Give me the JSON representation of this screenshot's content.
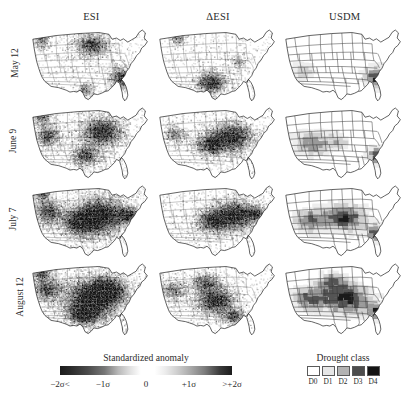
{
  "figure": {
    "columns": [
      {
        "id": "esi",
        "label": "ESI"
      },
      {
        "id": "desi",
        "label": "ΔESI"
      },
      {
        "id": "usdm",
        "label": "USDM"
      }
    ],
    "rows": [
      {
        "id": "may12",
        "label": "May 12"
      },
      {
        "id": "june9",
        "label": "June 9"
      },
      {
        "id": "july7",
        "label": "July 7"
      },
      {
        "id": "august12",
        "label": "August 12"
      }
    ]
  },
  "legend_anomaly": {
    "title": "Standardized anomaly",
    "ticks": [
      {
        "label": "−2σ<",
        "pos": 0
      },
      {
        "label": "−1σ",
        "pos": 25
      },
      {
        "label": "0",
        "pos": 50
      },
      {
        "label": "+1σ",
        "pos": 75
      },
      {
        "label": ">+2σ",
        "pos": 100
      }
    ]
  },
  "legend_drought": {
    "title": "Drought class",
    "classes": [
      {
        "label": "D0",
        "color": "#ffffff"
      },
      {
        "label": "D1",
        "color": "#e6e6e6"
      },
      {
        "label": "D2",
        "color": "#b3b3b3"
      },
      {
        "label": "D3",
        "color": "#4d4d4d"
      },
      {
        "label": "D4",
        "color": "#141414"
      }
    ]
  },
  "chart_data": {
    "type": "heatmap",
    "title": "Standardized anomaly",
    "xlabel": "",
    "ylabel": "",
    "grid": false,
    "legend_position": "bottom",
    "categories": [
      "ESI",
      "ΔESI",
      "USDM"
    ],
    "rows": [
      "May 12",
      "June 9",
      "July 7",
      "August 12"
    ],
    "colormap": "grayscale-diverging",
    "value_range": [
      -2,
      2
    ],
    "units": "standardized anomaly (sigma)",
    "panels": [
      {
        "row": "May 12",
        "column": "ESI",
        "metric": "standardized anomaly",
        "drought_extent_fraction": 0.18,
        "peak_intensity": -2.0,
        "centers": [
          {
            "name": "Upper Midwest",
            "x": 0.5,
            "y": 0.24,
            "rx": 0.13,
            "ry": 0.14,
            "intensity": -1.7
          },
          {
            "name": "Southeast / Georgia",
            "x": 0.74,
            "y": 0.66,
            "rx": 0.09,
            "ry": 0.13,
            "intensity": -2.0
          },
          {
            "name": "Northwest",
            "x": 0.1,
            "y": 0.17,
            "rx": 0.07,
            "ry": 0.1,
            "intensity": -1.4
          },
          {
            "name": "Texas coast",
            "x": 0.45,
            "y": 0.82,
            "rx": 0.07,
            "ry": 0.08,
            "intensity": -1.2
          }
        ],
        "texture": "fine-speckle",
        "speckle_density": 0.55
      },
      {
        "row": "May 12",
        "column": "ΔESI",
        "metric": "change in standardized anomaly",
        "drought_extent_fraction": 0.12,
        "peak_intensity": -2.0,
        "centers": [
          {
            "name": "Southern Plains / Texas",
            "x": 0.44,
            "y": 0.72,
            "rx": 0.11,
            "ry": 0.14,
            "intensity": -2.0
          },
          {
            "name": "Northern Rockies",
            "x": 0.17,
            "y": 0.16,
            "rx": 0.06,
            "ry": 0.08,
            "intensity": -1.2
          },
          {
            "name": "Ohio Valley",
            "x": 0.66,
            "y": 0.45,
            "rx": 0.06,
            "ry": 0.07,
            "intensity": -1.1
          }
        ],
        "texture": "fine-speckle",
        "speckle_density": 0.42
      },
      {
        "row": "May 12",
        "column": "USDM",
        "metric": "drought class",
        "drought_extent_fraction": 0.1,
        "peak_intensity": -2.0,
        "centers": [
          {
            "name": "Southeast / Georgia",
            "x": 0.76,
            "y": 0.66,
            "rx": 0.1,
            "ry": 0.14,
            "intensity": -2.0
          },
          {
            "name": "Southwest",
            "x": 0.17,
            "y": 0.58,
            "rx": 0.1,
            "ry": 0.12,
            "intensity": -1.0
          }
        ],
        "texture": "polygon-blocks",
        "speckle_density": 0.1
      },
      {
        "row": "June 9",
        "column": "ESI",
        "metric": "standardized anomaly",
        "drought_extent_fraction": 0.34,
        "peak_intensity": -2.0,
        "centers": [
          {
            "name": "Corn Belt / Midwest",
            "x": 0.58,
            "y": 0.35,
            "rx": 0.16,
            "ry": 0.18,
            "intensity": -2.0
          },
          {
            "name": "Great Basin",
            "x": 0.15,
            "y": 0.4,
            "rx": 0.1,
            "ry": 0.14,
            "intensity": -1.5
          },
          {
            "name": "Southern Plains",
            "x": 0.45,
            "y": 0.66,
            "rx": 0.11,
            "ry": 0.13,
            "intensity": -1.6
          },
          {
            "name": "Northwest",
            "x": 0.1,
            "y": 0.16,
            "rx": 0.07,
            "ry": 0.09,
            "intensity": -1.3
          }
        ],
        "texture": "fine-speckle",
        "speckle_density": 0.7
      },
      {
        "row": "June 9",
        "column": "ΔESI",
        "metric": "change in standardized anomaly",
        "drought_extent_fraction": 0.3,
        "peak_intensity": -2.0,
        "centers": [
          {
            "name": "Corn Belt core",
            "x": 0.6,
            "y": 0.42,
            "rx": 0.17,
            "ry": 0.19,
            "intensity": -2.0
          },
          {
            "name": "Central Plains",
            "x": 0.42,
            "y": 0.52,
            "rx": 0.11,
            "ry": 0.13,
            "intensity": -1.6
          },
          {
            "name": "Great Basin",
            "x": 0.15,
            "y": 0.38,
            "rx": 0.08,
            "ry": 0.11,
            "intensity": -1.2
          }
        ],
        "texture": "fine-speckle",
        "speckle_density": 0.62
      },
      {
        "row": "June 9",
        "column": "USDM",
        "metric": "drought class",
        "drought_extent_fraction": 0.22,
        "peak_intensity": -1.6,
        "centers": [
          {
            "name": "Southwest / Four Corners",
            "x": 0.24,
            "y": 0.5,
            "rx": 0.14,
            "ry": 0.16,
            "intensity": -1.5
          },
          {
            "name": "Southeast / Georgia",
            "x": 0.76,
            "y": 0.66,
            "rx": 0.08,
            "ry": 0.11,
            "intensity": -1.8
          },
          {
            "name": "Central Plains",
            "x": 0.45,
            "y": 0.48,
            "rx": 0.1,
            "ry": 0.11,
            "intensity": -1.0
          }
        ],
        "texture": "polygon-blocks",
        "speckle_density": 0.12
      },
      {
        "row": "July 7",
        "column": "ESI",
        "metric": "standardized anomaly",
        "drought_extent_fraction": 0.52,
        "peak_intensity": -2.0,
        "centers": [
          {
            "name": "Corn Belt core",
            "x": 0.58,
            "y": 0.42,
            "rx": 0.2,
            "ry": 0.22,
            "intensity": -2.0
          },
          {
            "name": "Central Plains",
            "x": 0.42,
            "y": 0.52,
            "rx": 0.15,
            "ry": 0.17,
            "intensity": -1.9
          },
          {
            "name": "Great Basin",
            "x": 0.15,
            "y": 0.38,
            "rx": 0.11,
            "ry": 0.15,
            "intensity": -1.6
          },
          {
            "name": "Mid-Atlantic",
            "x": 0.8,
            "y": 0.42,
            "rx": 0.08,
            "ry": 0.1,
            "intensity": -1.5
          },
          {
            "name": "Northwest",
            "x": 0.1,
            "y": 0.15,
            "rx": 0.07,
            "ry": 0.09,
            "intensity": -1.4
          }
        ],
        "texture": "fine-speckle",
        "speckle_density": 0.86
      },
      {
        "row": "July 7",
        "column": "ΔESI",
        "metric": "change in standardized anomaly",
        "drought_extent_fraction": 0.42,
        "peak_intensity": -2.0,
        "centers": [
          {
            "name": "Corn Belt / Ohio Valley",
            "x": 0.63,
            "y": 0.42,
            "rx": 0.18,
            "ry": 0.19,
            "intensity": -2.0
          },
          {
            "name": "Central Plains",
            "x": 0.44,
            "y": 0.5,
            "rx": 0.12,
            "ry": 0.14,
            "intensity": -1.6
          },
          {
            "name": "Mid-Atlantic",
            "x": 0.8,
            "y": 0.4,
            "rx": 0.07,
            "ry": 0.09,
            "intensity": -1.4
          }
        ],
        "texture": "fine-speckle",
        "speckle_density": 0.72
      },
      {
        "row": "July 7",
        "column": "USDM",
        "metric": "drought class",
        "drought_extent_fraction": 0.4,
        "peak_intensity": -2.0,
        "centers": [
          {
            "name": "Central Plains / Midwest",
            "x": 0.5,
            "y": 0.46,
            "rx": 0.18,
            "ry": 0.18,
            "intensity": -1.9
          },
          {
            "name": "Southwest",
            "x": 0.22,
            "y": 0.5,
            "rx": 0.13,
            "ry": 0.16,
            "intensity": -1.5
          },
          {
            "name": "Southeast / Georgia",
            "x": 0.76,
            "y": 0.66,
            "rx": 0.08,
            "ry": 0.11,
            "intensity": -1.8
          }
        ],
        "texture": "polygon-blocks",
        "speckle_density": 0.14
      },
      {
        "row": "August 12",
        "column": "ESI",
        "metric": "standardized anomaly",
        "drought_extent_fraction": 0.58,
        "peak_intensity": -2.0,
        "centers": [
          {
            "name": "Central Plains / Corn Belt core",
            "x": 0.5,
            "y": 0.5,
            "rx": 0.22,
            "ry": 0.24,
            "intensity": -2.0
          },
          {
            "name": "Midwest",
            "x": 0.62,
            "y": 0.38,
            "rx": 0.15,
            "ry": 0.16,
            "intensity": -1.9
          },
          {
            "name": "Great Basin",
            "x": 0.14,
            "y": 0.36,
            "rx": 0.11,
            "ry": 0.15,
            "intensity": -1.5
          },
          {
            "name": "Southern Plains",
            "x": 0.44,
            "y": 0.7,
            "rx": 0.12,
            "ry": 0.13,
            "intensity": -1.7
          },
          {
            "name": "Northwest",
            "x": 0.1,
            "y": 0.15,
            "rx": 0.07,
            "ry": 0.09,
            "intensity": -1.5
          }
        ],
        "texture": "fine-speckle",
        "speckle_density": 0.92
      },
      {
        "row": "August 12",
        "column": "ΔESI",
        "metric": "change in standardized anomaly",
        "drought_extent_fraction": 0.36,
        "peak_intensity": -2.0,
        "centers": [
          {
            "name": "Central Plains",
            "x": 0.47,
            "y": 0.52,
            "rx": 0.15,
            "ry": 0.16,
            "intensity": -2.0
          },
          {
            "name": "Northern Plains",
            "x": 0.4,
            "y": 0.28,
            "rx": 0.11,
            "ry": 0.12,
            "intensity": -1.5
          },
          {
            "name": "Great Basin",
            "x": 0.14,
            "y": 0.38,
            "rx": 0.09,
            "ry": 0.12,
            "intensity": -1.3
          },
          {
            "name": "Deep South",
            "x": 0.62,
            "y": 0.72,
            "rx": 0.09,
            "ry": 0.1,
            "intensity": -1.4
          }
        ],
        "texture": "fine-speckle",
        "speckle_density": 0.66
      },
      {
        "row": "August 12",
        "column": "USDM",
        "metric": "drought class",
        "drought_extent_fraction": 0.55,
        "peak_intensity": -2.0,
        "centers": [
          {
            "name": "Central Plains / Midwest core",
            "x": 0.52,
            "y": 0.5,
            "rx": 0.2,
            "ry": 0.2,
            "intensity": -2.0
          },
          {
            "name": "Southwest",
            "x": 0.22,
            "y": 0.5,
            "rx": 0.14,
            "ry": 0.17,
            "intensity": -1.5
          },
          {
            "name": "Northern Plains",
            "x": 0.4,
            "y": 0.28,
            "rx": 0.12,
            "ry": 0.12,
            "intensity": -1.4
          },
          {
            "name": "Southeast / Georgia",
            "x": 0.76,
            "y": 0.66,
            "rx": 0.08,
            "ry": 0.1,
            "intensity": -1.7
          }
        ],
        "texture": "polygon-blocks",
        "speckle_density": 0.16
      }
    ]
  }
}
